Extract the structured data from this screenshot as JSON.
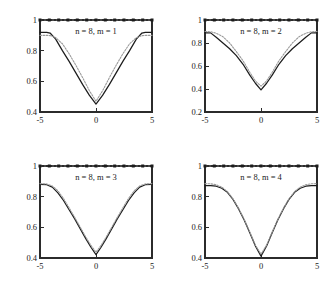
{
  "figure": {
    "layout": "2x2 grid of line plots",
    "background_color": "#ffffff",
    "curve_solid_color": "#1c1c1c",
    "curve_dotted_color": "#9a9a9a",
    "axis_color": "#2b2b2b"
  },
  "chart_data": [
    {
      "type": "line",
      "title": "n = 8, m = 1",
      "xlabel": "",
      "ylabel": "",
      "xlim": [
        -5,
        5
      ],
      "ylim": [
        0.4,
        1
      ],
      "xticks": [
        -5,
        0,
        5
      ],
      "xticklabels": [
        "-5",
        "0",
        "5"
      ],
      "yticks": [
        0.4,
        0.6,
        0.8,
        1
      ],
      "yticklabels": [
        "0.4",
        "0.6",
        "0.8",
        "1"
      ],
      "grid": false,
      "legend": "none",
      "series": [
        {
          "name": "solid",
          "style": "solid",
          "x": [
            -5,
            -4.4,
            -4.1,
            -3.6,
            -3.0,
            -2.4,
            -1.8,
            -1.2,
            -0.6,
            0,
            0.6,
            1.2,
            1.8,
            2.4,
            3.0,
            3.6,
            4.1,
            4.4,
            5
          ],
          "values": [
            0.92,
            0.92,
            0.915,
            0.875,
            0.8,
            0.73,
            0.655,
            0.58,
            0.51,
            0.452,
            0.51,
            0.58,
            0.655,
            0.73,
            0.8,
            0.875,
            0.915,
            0.92,
            0.92
          ]
        },
        {
          "name": "dotted",
          "style": "dotted",
          "x": [
            -5,
            -4.4,
            -4.1,
            -3.6,
            -3.0,
            -2.4,
            -1.8,
            -1.2,
            -0.6,
            0,
            0.6,
            1.2,
            1.8,
            2.4,
            3.0,
            3.6,
            4.1,
            4.4,
            5
          ],
          "values": [
            0.9,
            0.9,
            0.898,
            0.885,
            0.845,
            0.78,
            0.705,
            0.625,
            0.54,
            0.47,
            0.54,
            0.625,
            0.705,
            0.78,
            0.845,
            0.885,
            0.898,
            0.9,
            0.9
          ]
        },
        {
          "name": "reference-line-at-1",
          "style": "markers",
          "x": [
            -5,
            -4.17,
            -3.33,
            -2.5,
            -1.67,
            -0.83,
            0,
            0.83,
            1.67,
            2.5,
            3.33,
            4.17,
            5
          ],
          "values": [
            1,
            1,
            1,
            1,
            1,
            1,
            1,
            1,
            1,
            1,
            1,
            1,
            1
          ]
        }
      ]
    },
    {
      "type": "line",
      "title": "n = 8, m = 2",
      "xlabel": "",
      "ylabel": "",
      "xlim": [
        -5,
        5
      ],
      "ylim": [
        0.2,
        1
      ],
      "xticks": [
        -5,
        0,
        5
      ],
      "xticklabels": [
        "-5",
        "0",
        "5"
      ],
      "yticks": [
        0.2,
        0.4,
        0.6,
        0.8,
        1
      ],
      "yticklabels": [
        "0.2",
        "0.4",
        "0.6",
        "0.8",
        "1"
      ],
      "grid": false,
      "legend": "none",
      "series": [
        {
          "name": "solid",
          "style": "solid",
          "x": [
            -5,
            -4.5,
            -4.0,
            -3.4,
            -2.8,
            -2.2,
            -1.6,
            -1.0,
            -0.5,
            0,
            0.5,
            1.0,
            1.6,
            2.2,
            2.8,
            3.4,
            4.0,
            4.5,
            5
          ],
          "values": [
            0.888,
            0.888,
            0.85,
            0.8,
            0.75,
            0.69,
            0.615,
            0.52,
            0.45,
            0.392,
            0.45,
            0.52,
            0.615,
            0.69,
            0.75,
            0.8,
            0.85,
            0.888,
            0.888
          ]
        },
        {
          "name": "dotted",
          "style": "dotted",
          "x": [
            -5,
            -4.5,
            -4.0,
            -3.4,
            -2.8,
            -2.2,
            -1.6,
            -1.0,
            -0.5,
            0,
            0.5,
            1.0,
            1.6,
            2.2,
            2.8,
            3.4,
            4.0,
            4.5,
            5
          ],
          "values": [
            0.9,
            0.898,
            0.885,
            0.855,
            0.8,
            0.725,
            0.645,
            0.545,
            0.47,
            0.425,
            0.47,
            0.545,
            0.645,
            0.725,
            0.8,
            0.855,
            0.885,
            0.898,
            0.9
          ]
        },
        {
          "name": "reference-line-at-1",
          "style": "markers",
          "x": [
            -5,
            -4.17,
            -3.33,
            -2.5,
            -1.67,
            -0.83,
            0,
            0.83,
            1.67,
            2.5,
            3.33,
            4.17,
            5
          ],
          "values": [
            1,
            1,
            1,
            1,
            1,
            1,
            1,
            1,
            1,
            1,
            1,
            1,
            1
          ]
        }
      ]
    },
    {
      "type": "line",
      "title": "n = 8, m = 3",
      "xlabel": "",
      "ylabel": "",
      "xlim": [
        -5,
        5
      ],
      "ylim": [
        0.4,
        1
      ],
      "xticks": [
        -5,
        0,
        5
      ],
      "xticklabels": [
        "-5",
        "0",
        "5"
      ],
      "yticks": [
        0.4,
        0.6,
        0.8,
        1
      ],
      "yticklabels": [
        "0.4",
        "0.6",
        "0.8",
        "1"
      ],
      "grid": false,
      "legend": "none",
      "series": [
        {
          "name": "solid",
          "style": "solid",
          "x": [
            -5,
            -4.4,
            -3.9,
            -3.4,
            -2.9,
            -2.4,
            -1.9,
            -1.4,
            -0.9,
            -0.45,
            0,
            0.45,
            0.9,
            1.4,
            1.9,
            2.4,
            2.9,
            3.4,
            3.9,
            4.4,
            5
          ],
          "values": [
            0.88,
            0.878,
            0.862,
            0.825,
            0.775,
            0.715,
            0.655,
            0.59,
            0.525,
            0.47,
            0.422,
            0.47,
            0.525,
            0.59,
            0.655,
            0.715,
            0.775,
            0.825,
            0.862,
            0.878,
            0.88
          ]
        },
        {
          "name": "dotted",
          "style": "dotted",
          "x": [
            -5,
            -4.4,
            -3.9,
            -3.4,
            -2.9,
            -2.4,
            -1.9,
            -1.4,
            -0.9,
            -0.45,
            0,
            0.45,
            0.9,
            1.4,
            1.9,
            2.4,
            2.9,
            3.4,
            3.9,
            4.4,
            5
          ],
          "values": [
            0.885,
            0.883,
            0.87,
            0.838,
            0.788,
            0.727,
            0.665,
            0.6,
            0.535,
            0.482,
            0.438,
            0.482,
            0.535,
            0.6,
            0.665,
            0.727,
            0.788,
            0.838,
            0.87,
            0.883,
            0.885
          ]
        },
        {
          "name": "reference-line-at-1",
          "style": "markers",
          "x": [
            -5,
            -4.17,
            -3.33,
            -2.5,
            -1.67,
            -0.83,
            0,
            0.83,
            1.67,
            2.5,
            3.33,
            4.17,
            5
          ],
          "values": [
            1,
            1,
            1,
            1,
            1,
            1,
            1,
            1,
            1,
            1,
            1,
            1,
            1
          ]
        }
      ]
    },
    {
      "type": "line",
      "title": "n = 8, m = 4",
      "xlabel": "",
      "ylabel": "",
      "xlim": [
        -5,
        5
      ],
      "ylim": [
        0.4,
        1
      ],
      "xticks": [
        -5,
        0,
        5
      ],
      "xticklabels": [
        "-5",
        "0",
        "5"
      ],
      "yticks": [
        0.4,
        0.6,
        0.8,
        1
      ],
      "yticklabels": [
        "0.4",
        "0.6",
        "0.8",
        "1"
      ],
      "grid": false,
      "legend": "none",
      "series": [
        {
          "name": "solid",
          "style": "solid",
          "x": [
            -5,
            -4.5,
            -4.0,
            -3.5,
            -3.0,
            -2.5,
            -2.0,
            -1.5,
            -1.0,
            -0.5,
            0,
            0.5,
            1.0,
            1.5,
            2.0,
            2.5,
            3.0,
            3.5,
            4.0,
            4.5,
            5
          ],
          "values": [
            0.872,
            0.872,
            0.868,
            0.855,
            0.828,
            0.782,
            0.72,
            0.648,
            0.565,
            0.478,
            0.412,
            0.478,
            0.565,
            0.648,
            0.72,
            0.782,
            0.828,
            0.855,
            0.868,
            0.872,
            0.872
          ]
        },
        {
          "name": "dotted",
          "style": "dotted",
          "x": [
            -5,
            -4.5,
            -4.0,
            -3.5,
            -3.0,
            -2.5,
            -2.0,
            -1.5,
            -1.0,
            -0.5,
            0,
            0.5,
            1.0,
            1.5,
            2.0,
            2.5,
            3.0,
            3.5,
            4.0,
            4.5,
            5
          ],
          "values": [
            0.885,
            0.884,
            0.878,
            0.862,
            0.833,
            0.786,
            0.724,
            0.652,
            0.57,
            0.484,
            0.425,
            0.484,
            0.57,
            0.652,
            0.724,
            0.786,
            0.833,
            0.862,
            0.878,
            0.884,
            0.885
          ]
        },
        {
          "name": "reference-line-at-1",
          "style": "markers",
          "x": [
            -5,
            -4.17,
            -3.33,
            -2.5,
            -1.67,
            -0.83,
            0,
            0.83,
            1.67,
            2.5,
            3.33,
            4.17,
            5
          ],
          "values": [
            1,
            1,
            1,
            1,
            1,
            1,
            1,
            1,
            1,
            1,
            1,
            1,
            1
          ]
        }
      ]
    }
  ]
}
